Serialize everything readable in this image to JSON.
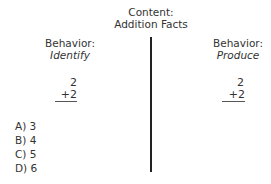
{
  "content": {
    "label": "Content:",
    "topic": "Addition Facts"
  },
  "left": {
    "label": "Behavior:",
    "behavior": "Identify",
    "problem": {
      "top": "2",
      "bottom": "+2"
    },
    "options": [
      "A) 3",
      "B) 4",
      "C) 5",
      "D) 6"
    ]
  },
  "right": {
    "label": "Behavior:",
    "behavior": "Produce",
    "problem": {
      "top": "2",
      "bottom": "+2"
    }
  },
  "colors": {
    "text": "#333333",
    "divider": "#222222"
  }
}
